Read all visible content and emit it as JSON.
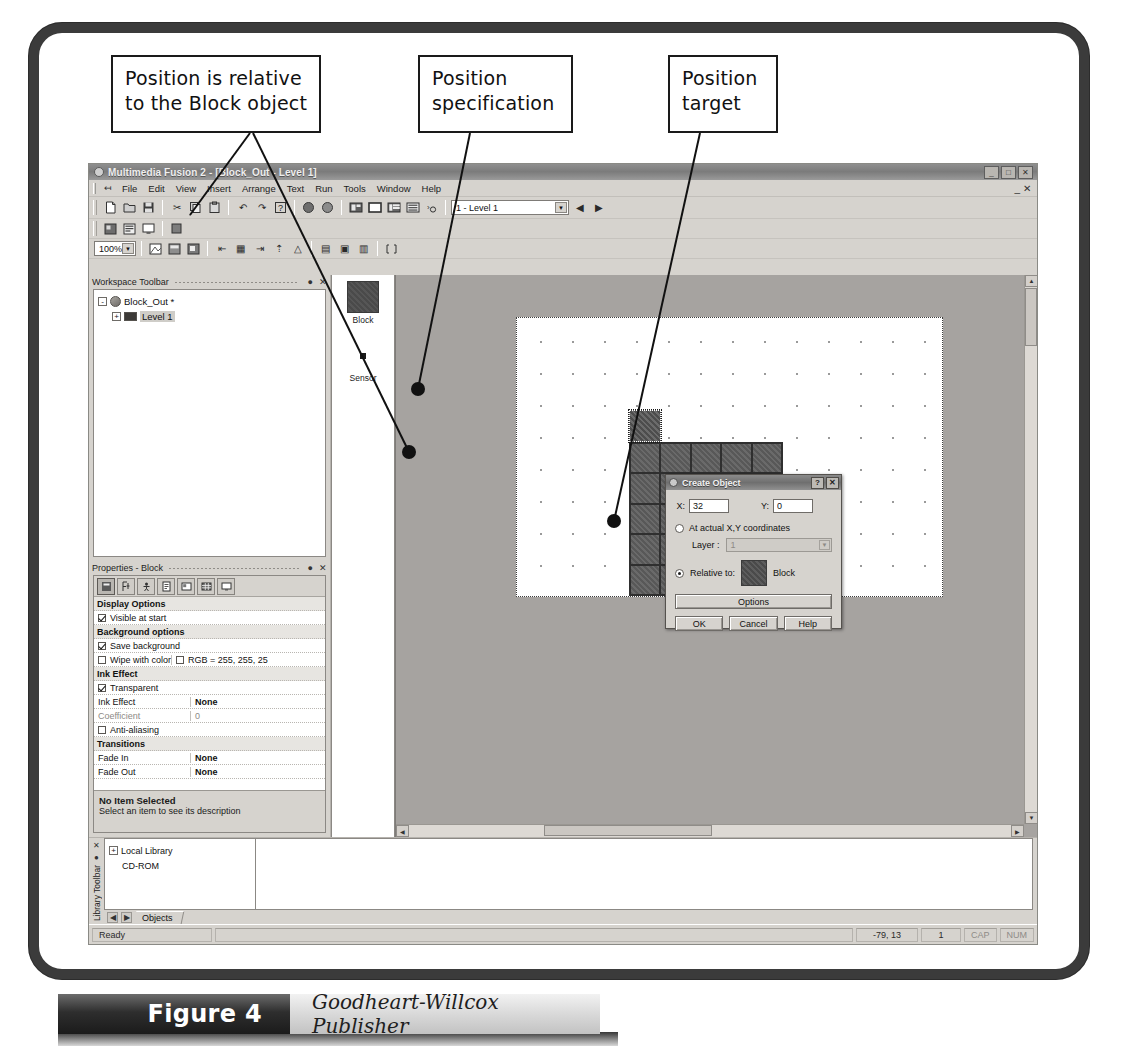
{
  "figure": {
    "number_label": "Figure 4",
    "credit": "Goodheart-Willcox Publisher"
  },
  "callouts": {
    "relative": "Position is relative to the Block object",
    "specification": "Position specification",
    "target": "Position target"
  },
  "app": {
    "title": "Multimedia Fusion 2 - [Block_Out - Level 1]",
    "title_buttons": [
      "_",
      "□",
      "✕"
    ],
    "mdi_buttons": [
      "_",
      "□",
      "✕"
    ],
    "menu": [
      "File",
      "Edit",
      "View",
      "Insert",
      "Arrange",
      "Text",
      "Run",
      "Tools",
      "Window",
      "Help"
    ],
    "level_combo_value": "1 - Level 1",
    "zoom_combo_value": "100%",
    "toolbar_icons": [
      "new-file-icon",
      "open-folder-icon",
      "save-disk-icon",
      "cut-scissors-icon",
      "copy-icon",
      "paste-icon",
      "undo-icon",
      "redo-icon",
      "help-question-icon",
      "run-application-icon",
      "run-frame-icon",
      "storyboard-editor-icon",
      "frame-editor-icon",
      "event-editor-icon",
      "event-list-icon",
      "step-through-icon"
    ],
    "toolbar2_icons": [
      "picture-editor-icon",
      "data-elements-icon",
      "screen-icon",
      "properties-icon"
    ],
    "toolbar3_icons": [
      "fit-window-icon",
      "zoom-frame-icon",
      "zoom-area-icon",
      "align-left-icon",
      "align-center-icon",
      "align-right-icon",
      "align-top-icon",
      "align-middle-icon",
      "align-bottom-icon",
      "resize-handles-icon"
    ]
  },
  "workspace_panel": {
    "title": "Workspace Toolbar",
    "pin_icon": "pin-icon",
    "close_icon": "close-icon",
    "tree": [
      {
        "label": "Block_Out *",
        "icon": "application-icon",
        "expander": "-",
        "level": 0,
        "selected": false
      },
      {
        "label": "Level 1",
        "icon": "frame-icon",
        "expander": "+",
        "level": 1,
        "selected": true
      }
    ]
  },
  "object_strip": {
    "items": [
      {
        "name": "Block",
        "icon": "block-sprite-icon"
      },
      {
        "name": "Sensor",
        "icon": "sensor-dot-icon"
      }
    ]
  },
  "properties_panel": {
    "title": "Properties - Block",
    "pin_icon": "pin-icon",
    "close_icon": "close-icon",
    "tabs": [
      {
        "icon": "settings-tab-icon",
        "active": true
      },
      {
        "icon": "size-position-tab-icon",
        "active": false
      },
      {
        "icon": "runtime-options-tab-icon",
        "active": false
      },
      {
        "icon": "events-tab-icon",
        "active": false
      },
      {
        "icon": "about-tab-icon",
        "active": false
      },
      {
        "icon": "values-tab-icon",
        "active": false
      },
      {
        "icon": "display-tab-icon",
        "active": false
      }
    ],
    "rows": [
      {
        "type": "section",
        "name": "Display Options"
      },
      {
        "type": "check",
        "name": "Visible at start",
        "checked": true,
        "enabled": true
      },
      {
        "type": "section",
        "name": "Background options"
      },
      {
        "type": "check",
        "name": "Save background",
        "checked": true,
        "enabled": true
      },
      {
        "type": "check-value",
        "name": "Wipe with color",
        "checked": false,
        "enabled": false,
        "value": "RGB = 255, 255, 25",
        "value_checked": false
      },
      {
        "type": "section",
        "name": "Ink Effect"
      },
      {
        "type": "check",
        "name": "Transparent",
        "checked": true,
        "enabled": true
      },
      {
        "type": "pair",
        "name": "Ink Effect",
        "value": "None",
        "enabled": true
      },
      {
        "type": "pair",
        "name": "Coefficient",
        "value": "0",
        "enabled": false
      },
      {
        "type": "check",
        "name": "Anti-aliasing",
        "checked": false,
        "enabled": true
      },
      {
        "type": "section",
        "name": "Transitions"
      },
      {
        "type": "pair",
        "name": "Fade In",
        "value": "None",
        "enabled": true
      },
      {
        "type": "pair",
        "name": "Fade Out",
        "value": "None",
        "enabled": true
      }
    ],
    "description_title": "No Item Selected",
    "description_text": "Select an item to see its description"
  },
  "create_dialog": {
    "title": "Create Object",
    "help_button": "?",
    "close_button": "✕",
    "x_label": "X:",
    "x_value": "32",
    "y_label": "Y:",
    "y_value": "0",
    "actual_coords_label": "At actual X,Y coordinates",
    "actual_coords_selected": false,
    "layer_label": "Layer :",
    "layer_value": "1",
    "relative_to_label": "Relative to:",
    "relative_to_selected": true,
    "relative_object_name": "Block",
    "options_button": "Options",
    "ok_button": "OK",
    "cancel_button": "Cancel",
    "help_button_label": "Help"
  },
  "library_panel": {
    "rail_close_icon": "close-icon",
    "rail_pin_icon": "pin-icon",
    "rail_title": "Library Toolbar",
    "tree": [
      {
        "label": "Local Library",
        "expander": "+",
        "level": 0
      },
      {
        "label": "CD-ROM",
        "expander": "",
        "level": 0
      }
    ],
    "nav_prev_icon": "nav-prev-icon",
    "nav_next_icon": "nav-next-icon",
    "tab_label": "Objects"
  },
  "statusbar": {
    "ready": "Ready",
    "coordinates": "-79, 13",
    "layer": "1",
    "caps": "CAP",
    "num": "NUM"
  }
}
